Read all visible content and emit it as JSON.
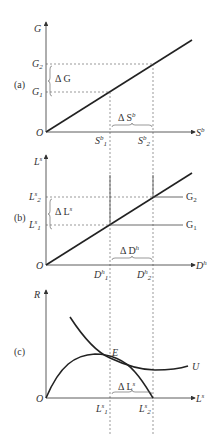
{
  "figure": {
    "panel_a": {
      "tag": "(a)",
      "y_axis": "G",
      "x_axis": "S",
      "x_axis_sup": "b",
      "origin": "O",
      "y_ticks": [
        {
          "base": "G",
          "sub": "2"
        },
        {
          "base": "G",
          "sub": "1"
        }
      ],
      "x_ticks": [
        {
          "base": "S",
          "sup": "b",
          "sub": "1"
        },
        {
          "base": "S",
          "sup": "b",
          "sub": "2"
        }
      ],
      "delta_y": "Δ G",
      "delta_x": "Δ S",
      "delta_x_sup": "b"
    },
    "panel_b": {
      "tag": "(b)",
      "y_axis": "L",
      "y_axis_sup": "s",
      "x_axis": "D",
      "x_axis_sup": "h",
      "origin": "O",
      "y_ticks": [
        {
          "base": "L",
          "sup": "s",
          "sub": "2"
        },
        {
          "base": "L",
          "sup": "s",
          "sub": "1"
        }
      ],
      "x_ticks": [
        {
          "base": "D",
          "sup": "h",
          "sub": "1"
        },
        {
          "base": "D",
          "sup": "h",
          "sub": "2"
        }
      ],
      "line_labels": [
        "G2",
        "G1"
      ],
      "delta_y": "Δ L",
      "delta_y_sup": "s",
      "delta_x": "Δ D",
      "delta_x_sup": "h"
    },
    "panel_c": {
      "tag": "(c)",
      "y_axis": "R",
      "x_axis": "L",
      "x_axis_sup": "s",
      "origin": "O",
      "x_ticks": [
        {
          "base": "L",
          "sup": "s",
          "sub": "1"
        },
        {
          "base": "L",
          "sup": "s",
          "sub": "2"
        }
      ],
      "point_label": "E",
      "curve_label": "U",
      "delta_x": "Δ L",
      "delta_x_sup": "s"
    }
  }
}
